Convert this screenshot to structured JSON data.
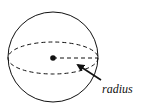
{
  "diagram": {
    "label": "radius",
    "colors": {
      "stroke": "#111111",
      "background": "#ffffff"
    },
    "elements": [
      "sphere-outline",
      "equator-ellipse-dashed",
      "center-point",
      "radius-line-dashed",
      "pointer-arrow",
      "radius-label"
    ]
  }
}
